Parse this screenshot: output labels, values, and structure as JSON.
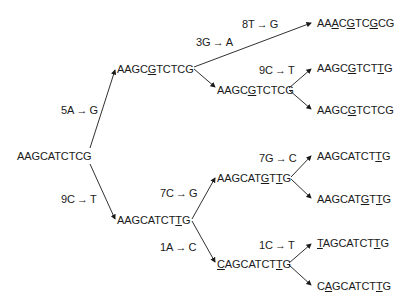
{
  "diagram": {
    "type": "mutation-tree",
    "root": {
      "id": "root",
      "sequence": "AAGCATCTCG",
      "mutated_positions": []
    },
    "nodes": [
      {
        "id": "root",
        "sequence": "AAGCATCTCG",
        "mutated_positions": []
      },
      {
        "id": "n1",
        "sequence": "AAGCGTCTCG",
        "mutated_positions": [
          5
        ]
      },
      {
        "id": "n2",
        "sequence": "AAGCATCTTG",
        "mutated_positions": [
          9
        ]
      },
      {
        "id": "n1a",
        "sequence": "AAACGTCGCG",
        "mutated_positions": [
          3,
          5,
          8
        ]
      },
      {
        "id": "n1b",
        "sequence": "AAGCGTCTCG",
        "mutated_positions": [
          5
        ]
      },
      {
        "id": "n1b1",
        "sequence": "AAGCGTCTTG",
        "mutated_positions": [
          5,
          9
        ]
      },
      {
        "id": "n1b2",
        "sequence": "AAGCGTCTCG",
        "mutated_positions": [
          5
        ]
      },
      {
        "id": "n2a",
        "sequence": "AAGCATGTTG",
        "mutated_positions": [
          7,
          9
        ]
      },
      {
        "id": "n2a1",
        "sequence": "AAGCATCTTG",
        "mutated_positions": [
          9
        ]
      },
      {
        "id": "n2a2",
        "sequence": "AAGCATGTTG",
        "mutated_positions": [
          7,
          9
        ]
      },
      {
        "id": "n2b",
        "sequence": "CAGCATCTTG",
        "mutated_positions": [
          1,
          9
        ]
      },
      {
        "id": "n2b1",
        "sequence": "TAGCATCTTG",
        "mutated_positions": [
          1,
          9
        ]
      },
      {
        "id": "n2b2",
        "sequence": "CAGCATCTTG",
        "mutated_positions": [
          2,
          9
        ]
      }
    ],
    "edges": [
      {
        "from": "root",
        "to": "n1",
        "mutation": "5A → G"
      },
      {
        "from": "root",
        "to": "n2",
        "mutation": "9C → T"
      },
      {
        "from": "n1",
        "to": "n1a",
        "mutation": "3G → A"
      },
      {
        "from": "n1a_label2",
        "to": "n1a",
        "mutation": "8T → G"
      },
      {
        "from": "n1",
        "to": "n1b",
        "mutation": ""
      },
      {
        "from": "n1b",
        "to": "n1b1",
        "mutation": "9C → T"
      },
      {
        "from": "n1b",
        "to": "n1b2",
        "mutation": ""
      },
      {
        "from": "n2",
        "to": "n2a",
        "mutation": "7C → G"
      },
      {
        "from": "n2",
        "to": "n2b",
        "mutation": "1A → C"
      },
      {
        "from": "n2a",
        "to": "n2a1",
        "mutation": "7G → C"
      },
      {
        "from": "n2a",
        "to": "n2a2",
        "mutation": ""
      },
      {
        "from": "n2b",
        "to": "n2b1",
        "mutation": "1C → T"
      },
      {
        "from": "n2b",
        "to": "n2b2",
        "mutation": ""
      }
    ],
    "labels": {
      "l_5A": {
        "pos": "5A",
        "arrow": "→",
        "to": "G"
      },
      "l_9C": {
        "pos": "9C",
        "arrow": "→",
        "to": "T"
      },
      "l_3G": {
        "pos": "3G",
        "arrow": "→",
        "to": "A"
      },
      "l_8T": {
        "pos": "8T",
        "arrow": "→",
        "to": "G"
      },
      "l_9C2": {
        "pos": "9C",
        "arrow": "→",
        "to": "T"
      },
      "l_7C": {
        "pos": "7C",
        "arrow": "→",
        "to": "G"
      },
      "l_1A": {
        "pos": "1A",
        "arrow": "→",
        "to": "C"
      },
      "l_7G": {
        "pos": "7G",
        "arrow": "→",
        "to": "C"
      },
      "l_1C": {
        "pos": "1C",
        "arrow": "→",
        "to": "T"
      }
    },
    "colors": {
      "text": "#1a1a1a",
      "lines": "#1a1a1a",
      "background": "#ffffff"
    }
  }
}
